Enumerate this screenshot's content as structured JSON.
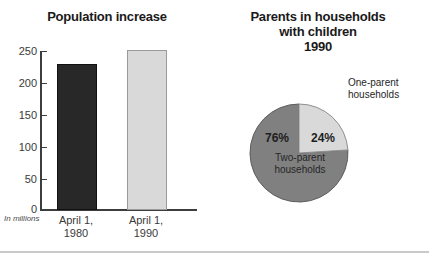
{
  "chart_data": [
    {
      "type": "bar",
      "title": "Population increase",
      "xlabel": "",
      "ylabel": "",
      "units_note": "In millions",
      "categories": [
        "April 1, 1980",
        "April 1, 1990"
      ],
      "category_lines": [
        [
          "April 1,",
          "1980"
        ],
        [
          "April 1,",
          "1990"
        ]
      ],
      "values": [
        226.5,
        248.7
      ],
      "ylim": [
        0,
        250
      ],
      "yticks": [
        0,
        50,
        100,
        150,
        200,
        250
      ],
      "ytick_labels": [
        "0",
        "50",
        "100",
        "150",
        "200",
        "250"
      ],
      "grid": false,
      "legend": "none",
      "bar_colors": [
        "#282828",
        "#d9d9d9"
      ]
    },
    {
      "type": "pie",
      "title_lines": [
        "Parents in households",
        "with children",
        "1990"
      ],
      "title": "Parents in households with children 1990",
      "labels": [
        "Two-parent households",
        "One-parent households"
      ],
      "label_lines": [
        [
          "Two-parent",
          "households"
        ],
        [
          "One-parent",
          "households"
        ]
      ],
      "values": [
        76,
        24
      ],
      "value_labels": [
        "76%",
        "24%"
      ],
      "colors": [
        "#808080",
        "#d9d9d9"
      ],
      "legend": "annotated",
      "start_angle_deg": 0
    }
  ],
  "bar_chart": {
    "title": "Population increase",
    "units_note": "In millions",
    "y_ticks": [
      {
        "label": "250",
        "value": 250
      },
      {
        "label": "200",
        "value": 200
      },
      {
        "label": "150",
        "value": 150
      },
      {
        "label": "100",
        "value": 100
      },
      {
        "label": "50",
        "value": 50
      },
      {
        "label": "0",
        "value": 0
      }
    ],
    "bars": [
      {
        "line1": "April 1,",
        "line2": "1980",
        "value": 226.5,
        "color": "#282828"
      },
      {
        "line1": "April 1,",
        "line2": "1990",
        "value": 248.7,
        "color": "#d9d9d9"
      }
    ]
  },
  "pie_chart": {
    "title_line1": "Parents in households",
    "title_line2": "with children",
    "title_line3": "1990",
    "slices": [
      {
        "pct_label": "76%",
        "value": 76,
        "name_line1": "Two-parent",
        "name_line2": "households",
        "color": "#808080"
      },
      {
        "pct_label": "24%",
        "value": 24,
        "name_line1": "One-parent",
        "name_line2": "households",
        "color": "#d9d9d9"
      }
    ]
  },
  "colors": {
    "dark_bar": "#282828",
    "light_bar": "#d9d9d9",
    "pie_major": "#808080",
    "pie_minor": "#d9d9d9",
    "axis": "#3d3d3d",
    "text": "#1a1a1a",
    "rule": "#c9c9c9"
  }
}
